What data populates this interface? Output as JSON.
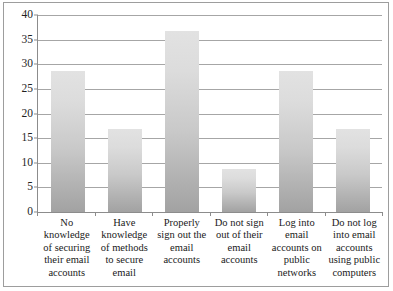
{
  "chart_data": {
    "type": "bar",
    "title": "",
    "subtitle": "",
    "xlabel": "",
    "ylabel": "",
    "ylim": [
      0,
      40
    ],
    "ytick_step": 5,
    "yticks": [
      0,
      5,
      10,
      15,
      20,
      25,
      30,
      35,
      40
    ],
    "grid": true,
    "legend": false,
    "legend_position": "none",
    "categories": [
      "No knowledge of securing their email accounts",
      "Have knowledge of methods to secure email",
      "Properly sign out the email accounts",
      "Do not sign out of their email accounts",
      "Log into email accounts on public networks",
      "Do not  log into email accounts using public computers"
    ],
    "values": [
      28.7,
      16.8,
      36.8,
      8.7,
      28.7,
      16.8
    ],
    "series": [
      {
        "name": "",
        "values": [
          28.7,
          16.8,
          36.8,
          8.7,
          28.7,
          16.8
        ]
      }
    ]
  },
  "style": {
    "bar_color_top": "#e2e2e2",
    "bar_color_bottom": "#a2a2a2",
    "gridline_color": "#a6a6a6",
    "axis_color": "#8c8c8c",
    "border_color": "#9d9d9d",
    "text_color": "#1a1a1a",
    "background": "#ffffff"
  }
}
